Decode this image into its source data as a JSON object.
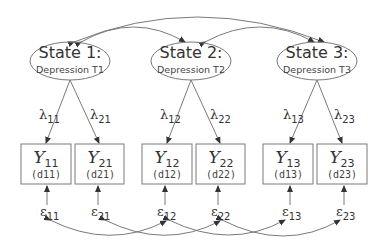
{
  "diagram": {
    "type": "structural-equation-model",
    "colors": {
      "stroke": "#7a7a7a",
      "text": "#333333",
      "background": "#ffffff"
    },
    "states": [
      {
        "id": "S1",
        "title": "State 1:",
        "subtitle": "Depression T1"
      },
      {
        "id": "S2",
        "title": "State 2:",
        "subtitle": "Depression T2"
      },
      {
        "id": "S3",
        "title": "State 3:",
        "subtitle": "Depression T3"
      }
    ],
    "loadings": [
      {
        "symbol": "λ",
        "sub": "11",
        "from": "S1",
        "to": "Y11"
      },
      {
        "symbol": "λ",
        "sub": "21",
        "from": "S1",
        "to": "Y21"
      },
      {
        "symbol": "λ",
        "sub": "12",
        "from": "S2",
        "to": "Y12"
      },
      {
        "symbol": "λ",
        "sub": "22",
        "from": "S2",
        "to": "Y22"
      },
      {
        "symbol": "λ",
        "sub": "13",
        "from": "S3",
        "to": "Y13"
      },
      {
        "symbol": "λ",
        "sub": "23",
        "from": "S3",
        "to": "Y23"
      }
    ],
    "indicators": [
      {
        "id": "Y11",
        "symbol": "Y",
        "sub": "11",
        "label": "(d11)"
      },
      {
        "id": "Y21",
        "symbol": "Y",
        "sub": "21",
        "label": "(d21)"
      },
      {
        "id": "Y12",
        "symbol": "Y",
        "sub": "12",
        "label": "(d12)"
      },
      {
        "id": "Y22",
        "symbol": "Y",
        "sub": "22",
        "label": "(d22)"
      },
      {
        "id": "Y13",
        "symbol": "Y",
        "sub": "13",
        "label": "(d13)"
      },
      {
        "id": "Y23",
        "symbol": "Y",
        "sub": "23",
        "label": "(d23)"
      }
    ],
    "errors": [
      {
        "symbol": "ε",
        "sub": "11"
      },
      {
        "symbol": "ε",
        "sub": "21"
      },
      {
        "symbol": "ε",
        "sub": "12"
      },
      {
        "symbol": "ε",
        "sub": "22"
      },
      {
        "symbol": "ε",
        "sub": "13"
      },
      {
        "symbol": "ε",
        "sub": "23"
      }
    ],
    "state_covariances": [
      {
        "from": "S1",
        "to": "S2"
      },
      {
        "from": "S2",
        "to": "S3"
      },
      {
        "from": "S1",
        "to": "S3"
      }
    ],
    "error_covariances": [
      {
        "from": "ε11",
        "to": "ε12"
      },
      {
        "from": "ε21",
        "to": "ε22"
      },
      {
        "from": "ε12",
        "to": "ε13"
      },
      {
        "from": "ε22",
        "to": "ε23"
      }
    ]
  }
}
